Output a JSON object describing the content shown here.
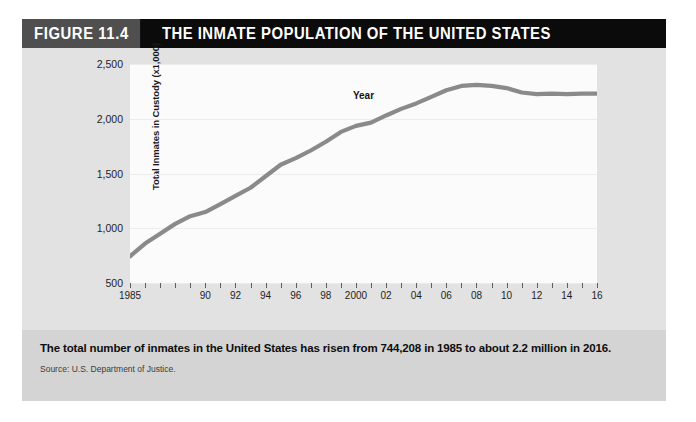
{
  "figure": {
    "number_label": "FIGURE 11.4",
    "title": "THE INMATE POPULATION OF THE UNITED STATES",
    "caption": "The total number of inmates in the United States has risen from 744,208 in 1985 to about 2.2 million in 2016.",
    "source": "Source: U.S. Department of Justice.",
    "colors": {
      "title_bar": "#0b0b0b",
      "figure_number_bg": "#4f4f4f",
      "panel_bg": "#e2e2e2",
      "plot_bg": "#fbfbfb",
      "caption_bg": "#d4d4d4",
      "line": "#8a8a8a"
    }
  },
  "chart_data": {
    "type": "line",
    "title": "THE INMATE POPULATION OF THE UNITED STATES",
    "xlabel": "Year",
    "ylabel": "Total Inmates in Custody (x1,000)",
    "ylim": [
      500,
      2500
    ],
    "xlim": [
      1985,
      2016
    ],
    "grid": true,
    "legend": null,
    "ytick_values": [
      500,
      1000,
      1500,
      2000,
      2500
    ],
    "ytick_labels": [
      "500",
      "1,000",
      "1,500",
      "2,000",
      "2,500"
    ],
    "xtick_values": [
      1985,
      1990,
      1992,
      1994,
      1996,
      1998,
      2000,
      2002,
      2004,
      2006,
      2008,
      2010,
      2012,
      2014,
      2016
    ],
    "xtick_labels": [
      "1985",
      "90",
      "92",
      "94",
      "96",
      "98",
      "2000",
      "02",
      "04",
      "06",
      "08",
      "10",
      "12",
      "14",
      "16"
    ],
    "x": [
      1985,
      1986,
      1987,
      1988,
      1989,
      1990,
      1991,
      1992,
      1993,
      1994,
      1995,
      1996,
      1997,
      1998,
      1999,
      2000,
      2001,
      2002,
      2003,
      2004,
      2005,
      2006,
      2007,
      2008,
      2009,
      2010,
      2011,
      2012,
      2013,
      2014,
      2015,
      2016
    ],
    "values": [
      744,
      860,
      950,
      1040,
      1110,
      1148,
      1220,
      1295,
      1370,
      1475,
      1580,
      1640,
      1710,
      1790,
      1880,
      1935,
      1965,
      2030,
      2090,
      2140,
      2200,
      2260,
      2300,
      2310,
      2300,
      2280,
      2240,
      2225,
      2230,
      2225,
      2230,
      2230
    ],
    "series_name": "Total inmates in custody (thousands)",
    "annotations": []
  }
}
